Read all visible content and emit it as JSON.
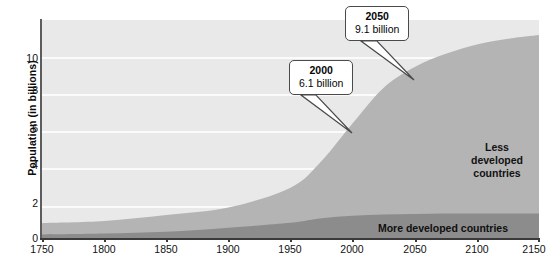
{
  "chart_data": {
    "type": "area",
    "title": "",
    "subtitle": "",
    "xlabel": "",
    "ylabel": "Population (in billions)",
    "xlim": [
      1750,
      2150
    ],
    "ylim": [
      0,
      11.6
    ],
    "grid": true,
    "legend_position": "in-plot annotations",
    "x_ticks": [
      "1750",
      "1800",
      "1850",
      "1900",
      "1950",
      "2000",
      "2050",
      "2100",
      "2150"
    ],
    "y_ticks": [
      "0",
      "2",
      "4",
      "6",
      "8",
      "10"
    ],
    "x": [
      1750,
      1800,
      1850,
      1900,
      1950,
      1975,
      2000,
      2025,
      2050,
      2075,
      2100,
      2125,
      2150
    ],
    "series": [
      {
        "name": "More developed countries",
        "values": [
          0.19,
          0.24,
          0.33,
          0.55,
          0.81,
          1.05,
          1.19,
          1.25,
          1.28,
          1.3,
          1.3,
          1.3,
          1.3
        ]
      },
      {
        "name": "Less developed countries",
        "values": [
          0.6,
          0.66,
          0.89,
          1.07,
          1.87,
          3.05,
          4.91,
          6.75,
          7.82,
          8.5,
          9.0,
          9.3,
          9.5
        ]
      }
    ],
    "totals": [
      0.79,
      0.9,
      1.22,
      1.62,
      2.68,
      4.1,
      6.1,
      8.0,
      9.1,
      9.8,
      10.3,
      10.6,
      10.8
    ],
    "annotations": [
      {
        "year": "2000",
        "value": "6.1 billion",
        "point": [
          2000,
          6.1
        ]
      },
      {
        "year": "2050",
        "value": "9.1 billion",
        "point": [
          2050,
          9.1
        ]
      }
    ],
    "colors": {
      "plot_background": "#e9e9e9",
      "gridline": "#fbfbfb",
      "less_developed_fill": "#b4b4b4",
      "more_developed_fill": "#8c8c8c",
      "axis": "#3a3a3a",
      "text": "#111111"
    }
  },
  "axis": {
    "ylabel": "Population (in billions)",
    "y_ticks": [
      "10",
      "8",
      "6",
      "4",
      "2",
      "0"
    ],
    "x_ticks": [
      "1750",
      "1800",
      "1850",
      "1900",
      "1950",
      "2000",
      "2050",
      "2100",
      "2150"
    ]
  },
  "labels": {
    "less_developed_line1": "Less",
    "less_developed_line2": "developed",
    "less_developed_line3": "countries",
    "more_developed": "More developed countries"
  },
  "callouts": {
    "c2000": {
      "year": "2000",
      "value": "6.1 billion"
    },
    "c2050": {
      "year": "2050",
      "value": "9.1 billion"
    }
  }
}
